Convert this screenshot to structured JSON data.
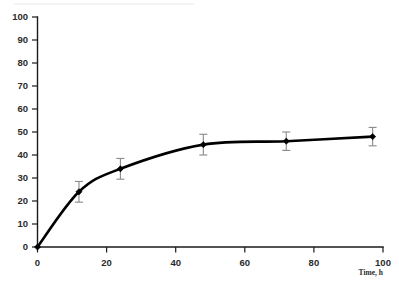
{
  "chart_data": {
    "type": "line",
    "title": "",
    "subtitle": "",
    "xlabel": "Time, h",
    "ylabel": "",
    "xlim": [
      0,
      100
    ],
    "ylim": [
      0,
      100
    ],
    "grid": false,
    "legend": false,
    "legend_position": "none",
    "x_ticks": [
      0,
      20,
      40,
      60,
      80,
      100
    ],
    "y_ticks": [
      0,
      10,
      20,
      30,
      40,
      50,
      60,
      70,
      80,
      90,
      100
    ],
    "x_tick_labels": [
      "0",
      "20",
      "40",
      "60",
      "80",
      "100"
    ],
    "y_tick_labels": [
      "0",
      "10",
      "20",
      "30",
      "40",
      "50",
      "60",
      "70",
      "80",
      "90",
      "100"
    ],
    "marker": "diamond",
    "marker_color": "#000000",
    "line_color": "#000000",
    "errorbar_color": "#8d8d8d",
    "x": [
      0,
      12,
      24,
      48,
      72,
      97
    ],
    "values": [
      0,
      24,
      34,
      44.5,
      46,
      48
    ],
    "yerr": [
      0,
      4.5,
      4.5,
      4.5,
      4,
      4
    ],
    "points": [
      {
        "x": 0,
        "y": 0,
        "err": 0
      },
      {
        "x": 12,
        "y": 24,
        "err": 4.5
      },
      {
        "x": 24,
        "y": 34,
        "err": 4.5
      },
      {
        "x": 48,
        "y": 44.5,
        "err": 4.5
      },
      {
        "x": 72,
        "y": 46,
        "err": 4
      },
      {
        "x": 97,
        "y": 48,
        "err": 4
      }
    ],
    "series": [
      {
        "name": "",
        "values": [
          0,
          24,
          34,
          44.5,
          46,
          48
        ]
      }
    ]
  }
}
